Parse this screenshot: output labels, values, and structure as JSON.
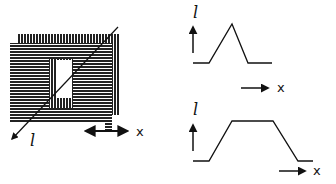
{
  "diagram": {
    "left_figure": {
      "description": "Striped rectangular structure with a window opening, a diagonal l-axis arrow, and a horizontal x double-arrow",
      "l_axis_label": "l",
      "x_axis_label": "x"
    },
    "top_right_plot": {
      "y_label": "l",
      "x_label": "x",
      "profile": "triangular peak"
    },
    "bottom_right_plot": {
      "y_label": "l",
      "x_label": "x",
      "profile": "trapezoidal plateau"
    },
    "colors": {
      "ink": "#111111",
      "background": "#ffffff"
    }
  }
}
